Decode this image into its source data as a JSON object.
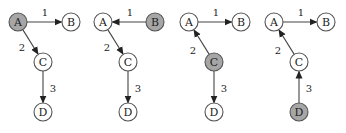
{
  "colors": {
    "highlight_fill": "#a6a6a6",
    "normal_fill": "#ffffff",
    "stroke": "#555555"
  },
  "node_radius": 9,
  "panels": [
    {
      "offset_x": 0,
      "highlighted": "A",
      "nodes": [
        {
          "id": "A",
          "label": "A",
          "x": 18,
          "y": 22
        },
        {
          "id": "B",
          "label": "B",
          "x": 71,
          "y": 22
        },
        {
          "id": "C",
          "label": "C",
          "x": 43,
          "y": 62
        },
        {
          "id": "D",
          "label": "D",
          "x": 43,
          "y": 112
        }
      ],
      "edges": [
        {
          "from": "A",
          "to": "B",
          "label": "1",
          "lx": 45,
          "ly": 12
        },
        {
          "from": "A",
          "to": "C",
          "label": "2",
          "lx": 22,
          "ly": 47
        },
        {
          "from": "C",
          "to": "D",
          "label": "3",
          "lx": 53,
          "ly": 88
        }
      ]
    },
    {
      "offset_x": 85,
      "highlighted": "B",
      "nodes": [
        {
          "id": "A",
          "label": "A",
          "x": 18,
          "y": 22
        },
        {
          "id": "B",
          "label": "B",
          "x": 70,
          "y": 22
        },
        {
          "id": "C",
          "label": "C",
          "x": 43,
          "y": 62
        },
        {
          "id": "D",
          "label": "D",
          "x": 43,
          "y": 112
        }
      ],
      "edges": [
        {
          "from": "B",
          "to": "A",
          "label": "1",
          "lx": 45,
          "ly": 12
        },
        {
          "from": "A",
          "to": "C",
          "label": "2",
          "lx": 22,
          "ly": 47
        },
        {
          "from": "C",
          "to": "D",
          "label": "3",
          "lx": 53,
          "ly": 88
        }
      ]
    },
    {
      "offset_x": 171,
      "highlighted": "C",
      "nodes": [
        {
          "id": "A",
          "label": "A",
          "x": 18,
          "y": 22
        },
        {
          "id": "B",
          "label": "B",
          "x": 70,
          "y": 22
        },
        {
          "id": "C",
          "label": "C",
          "x": 43,
          "y": 62
        },
        {
          "id": "D",
          "label": "D",
          "x": 43,
          "y": 112
        }
      ],
      "edges": [
        {
          "from": "A",
          "to": "B",
          "label": "1",
          "lx": 45,
          "ly": 12
        },
        {
          "from": "C",
          "to": "A",
          "label": "2",
          "lx": 22,
          "ly": 50
        },
        {
          "from": "C",
          "to": "D",
          "label": "3",
          "lx": 53,
          "ly": 88
        }
      ]
    },
    {
      "offset_x": 256,
      "highlighted": "D",
      "nodes": [
        {
          "id": "A",
          "label": "A",
          "x": 18,
          "y": 22
        },
        {
          "id": "B",
          "label": "B",
          "x": 70,
          "y": 22
        },
        {
          "id": "C",
          "label": "C",
          "x": 43,
          "y": 62
        },
        {
          "id": "D",
          "label": "D",
          "x": 43,
          "y": 112
        }
      ],
      "edges": [
        {
          "from": "A",
          "to": "B",
          "label": "1",
          "lx": 45,
          "ly": 12
        },
        {
          "from": "C",
          "to": "A",
          "label": "2",
          "lx": 22,
          "ly": 50
        },
        {
          "from": "D",
          "to": "C",
          "label": "3",
          "lx": 53,
          "ly": 88
        }
      ]
    }
  ]
}
